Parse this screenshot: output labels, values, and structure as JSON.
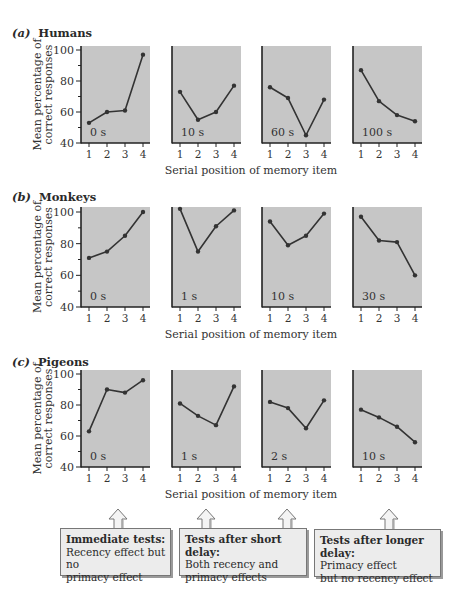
{
  "rows": [
    {
      "label": "(a)",
      "name": "Humans"
    },
    {
      "label": "(b)",
      "name": "Monkeys"
    },
    {
      "label": "(c)",
      "name": "Pigeons"
    }
  ],
  "ylabel_line1": "Mean percentage of",
  "ylabel_line2": "correct responses",
  "xlabel": "Serial position of memory item",
  "yticks": [
    "100",
    "80",
    "60",
    "40"
  ],
  "xticks": [
    "1",
    "2",
    "3",
    "4"
  ],
  "callouts": [
    {
      "head": "Immediate tests:",
      "body1": "Recency effect but no",
      "body2": "primacy effect"
    },
    {
      "head": "Tests after short delay:",
      "body1": "Both recency and",
      "body2": "primacy effects"
    },
    {
      "head": "Tests after longer delay:",
      "body1": "Primacy effect",
      "body2": "but no recency effect"
    }
  ],
  "colors": {
    "panel_bg": "#c6c6c6",
    "line": "#333333",
    "axis": "#222222"
  },
  "chart_data": [
    {
      "type": "line",
      "title": "(a) Humans",
      "xlabel": "Serial position of memory item",
      "ylabel": "Mean percentage of correct responses",
      "ylim": [
        40,
        100
      ],
      "x": [
        1,
        2,
        3,
        4
      ],
      "series": [
        {
          "name": "0 s",
          "values": [
            53,
            60,
            61,
            97
          ]
        },
        {
          "name": "10 s",
          "values": [
            73,
            55,
            60,
            77
          ]
        },
        {
          "name": "60 s",
          "values": [
            76,
            69,
            45,
            68
          ]
        },
        {
          "name": "100 s",
          "values": [
            87,
            67,
            58,
            54
          ]
        }
      ]
    },
    {
      "type": "line",
      "title": "(b) Monkeys",
      "xlabel": "Serial position of memory item",
      "ylabel": "Mean percentage of correct responses",
      "ylim": [
        40,
        100
      ],
      "x": [
        1,
        2,
        3,
        4
      ],
      "series": [
        {
          "name": "0 s",
          "values": [
            71,
            75,
            85,
            100
          ]
        },
        {
          "name": "1 s",
          "values": [
            102,
            75,
            91,
            101
          ]
        },
        {
          "name": "10 s",
          "values": [
            94,
            79,
            85,
            99
          ]
        },
        {
          "name": "30 s",
          "values": [
            97,
            82,
            81,
            60
          ]
        }
      ]
    },
    {
      "type": "line",
      "title": "(c) Pigeons",
      "xlabel": "Serial position of memory item",
      "ylabel": "Mean percentage of correct responses",
      "ylim": [
        40,
        100
      ],
      "x": [
        1,
        2,
        3,
        4
      ],
      "series": [
        {
          "name": "0 s",
          "values": [
            63,
            90,
            88,
            96
          ]
        },
        {
          "name": "1 s",
          "values": [
            81,
            73,
            67,
            92
          ]
        },
        {
          "name": "2 s",
          "values": [
            82,
            78,
            65,
            83
          ]
        },
        {
          "name": "10 s",
          "values": [
            77,
            72,
            66,
            56
          ]
        }
      ]
    }
  ]
}
